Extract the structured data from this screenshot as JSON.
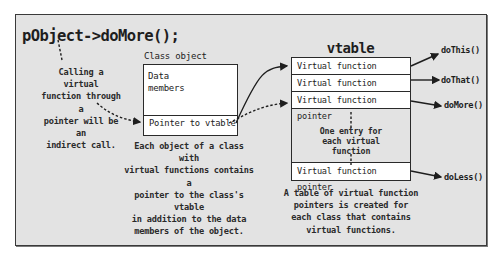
{
  "call_expression": "pObject->doMore();",
  "call_note": [
    "Calling a virtual",
    "function through a",
    "pointer will be an",
    "indirect call."
  ],
  "class_object": {
    "title": "Class object",
    "data_members_line1": "Data",
    "data_members_line2": "members",
    "pointer_row": "Pointer to vtable",
    "note": [
      "Each object of a class with",
      "virtual functions contains a",
      "pointer to the class's vtable",
      "in addition to the data",
      "members of the object."
    ]
  },
  "vtable": {
    "title": "vtable",
    "rows": [
      "Virtual function pointer",
      "Virtual function pointer",
      "Virtual function pointer",
      "Virtual function pointer"
    ],
    "middle_note": [
      "One entry for",
      "each virtual",
      "function"
    ],
    "note": [
      "A table of virtual function",
      "pointers is created for",
      "each class that contains",
      "virtual functions."
    ]
  },
  "functions": [
    "doThis()",
    "doThat()",
    "doMore()",
    "doLess()"
  ],
  "colors": {
    "panel_bg": "#e3e3e3",
    "box_bg": "#ffffff",
    "stroke": "#2a2a2a"
  }
}
